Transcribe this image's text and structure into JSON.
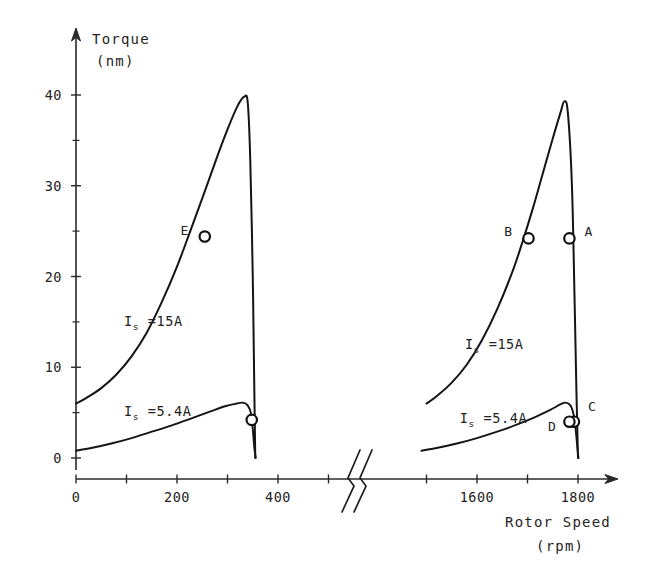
{
  "chart_data": {
    "type": "line",
    "title": "",
    "xlabel": "Rotor Speed",
    "xlabel_unit": "(rpm)",
    "ylabel": "Torque",
    "ylabel_unit": "(nm)",
    "grid": false,
    "legend_position": "inline-annotations",
    "axis_break": {
      "present": true,
      "between": [
        500,
        1450
      ],
      "symbol": "double-slash"
    },
    "ylim": [
      0,
      44
    ],
    "yticks": [
      0,
      10,
      20,
      30,
      40
    ],
    "ytick_labels": [
      "0",
      "10",
      "20",
      "30",
      "40"
    ],
    "yticks_minor": [
      5,
      15,
      25,
      35
    ],
    "xticks_left": [
      0,
      100,
      200,
      300,
      400,
      500
    ],
    "xtick_labels_left": [
      "0",
      "",
      "200",
      "",
      "400",
      ""
    ],
    "xticks_right": [
      1500,
      1600,
      1700,
      1800
    ],
    "xtick_labels_right": [
      "",
      "1600",
      "",
      "1800"
    ],
    "xlim_left": [
      0,
      560
    ],
    "xlim_right": [
      1440,
      1880
    ],
    "series": [
      {
        "name": "I_s =15A (low speed)",
        "current": "15A",
        "region": "left",
        "points": [
          [
            0,
            6.0
          ],
          [
            20,
            6.6
          ],
          [
            50,
            7.7
          ],
          [
            80,
            9.2
          ],
          [
            110,
            11.2
          ],
          [
            140,
            13.8
          ],
          [
            170,
            17.2
          ],
          [
            200,
            21.1
          ],
          [
            225,
            24.8
          ],
          [
            250,
            28.6
          ],
          [
            275,
            32.5
          ],
          [
            300,
            36.2
          ],
          [
            320,
            38.8
          ],
          [
            333,
            39.8
          ],
          [
            340,
            39.2
          ],
          [
            345,
            33.0
          ],
          [
            350,
            20.0
          ],
          [
            353,
            8.0
          ],
          [
            355,
            0.0
          ]
        ]
      },
      {
        "name": "I_s =5.4A (low speed)",
        "current": "5.4A",
        "region": "left",
        "points": [
          [
            0,
            0.8
          ],
          [
            30,
            1.1
          ],
          [
            70,
            1.6
          ],
          [
            110,
            2.2
          ],
          [
            150,
            2.9
          ],
          [
            190,
            3.6
          ],
          [
            230,
            4.4
          ],
          [
            265,
            5.1
          ],
          [
            295,
            5.7
          ],
          [
            318,
            6.0
          ],
          [
            330,
            6.1
          ],
          [
            340,
            5.8
          ],
          [
            347,
            4.8
          ],
          [
            350,
            3.2
          ],
          [
            353,
            1.2
          ],
          [
            356,
            0.0
          ]
        ]
      },
      {
        "name": "I_s =15A (high speed)",
        "current": "15A",
        "region": "right",
        "points": [
          [
            1500,
            6.0
          ],
          [
            1520,
            6.8
          ],
          [
            1550,
            8.3
          ],
          [
            1580,
            10.3
          ],
          [
            1610,
            13.0
          ],
          [
            1640,
            16.4
          ],
          [
            1670,
            20.5
          ],
          [
            1690,
            23.8
          ],
          [
            1710,
            27.4
          ],
          [
            1730,
            31.3
          ],
          [
            1750,
            35.2
          ],
          [
            1765,
            38.0
          ],
          [
            1773,
            39.3
          ],
          [
            1780,
            38.0
          ],
          [
            1788,
            30.0
          ],
          [
            1793,
            18.0
          ],
          [
            1797,
            7.0
          ],
          [
            1800,
            0.0
          ]
        ]
      },
      {
        "name": "I_s =5.4A (high speed)",
        "current": "5.4A",
        "region": "right",
        "points": [
          [
            1490,
            0.8
          ],
          [
            1520,
            1.1
          ],
          [
            1560,
            1.6
          ],
          [
            1600,
            2.2
          ],
          [
            1640,
            2.9
          ],
          [
            1680,
            3.7
          ],
          [
            1715,
            4.5
          ],
          [
            1745,
            5.3
          ],
          [
            1765,
            5.9
          ],
          [
            1775,
            6.1
          ],
          [
            1785,
            5.8
          ],
          [
            1792,
            4.6
          ],
          [
            1796,
            2.8
          ],
          [
            1799,
            1.0
          ],
          [
            1801,
            0.0
          ]
        ]
      }
    ],
    "annotations": [
      {
        "text": "I",
        "sub": "s",
        "rest": " =15A",
        "region": "left",
        "x": 95,
        "y": 14.6,
        "name": "label-left-15a"
      },
      {
        "text": "I",
        "sub": "s",
        "rest": " =5.4A",
        "region": "left",
        "x": 95,
        "y": 4.6,
        "name": "label-left-54a"
      },
      {
        "text": "I",
        "sub": "s",
        "rest": " =15A",
        "region": "right",
        "x": 1576,
        "y": 12.0,
        "name": "label-right-15a"
      },
      {
        "text": "I",
        "sub": "s",
        "rest": " =5.4A",
        "region": "right",
        "x": 1566,
        "y": 3.9,
        "name": "label-right-54a"
      }
    ],
    "points": [
      {
        "label": "A",
        "region": "right",
        "x": 1783,
        "y": 24.2,
        "label_side": "right",
        "name": "operating-point-a"
      },
      {
        "label": "B",
        "region": "right",
        "x": 1702,
        "y": 24.2,
        "label_side": "left",
        "name": "operating-point-b"
      },
      {
        "label": "C",
        "region": "right",
        "x": 1792,
        "y": 4.0,
        "label_side": "upper-right",
        "name": "operating-point-c"
      },
      {
        "label": "D",
        "region": "right",
        "x": 1783,
        "y": 4.0,
        "label_side": "lower-left",
        "name": "operating-point-d"
      },
      {
        "label": "E",
        "region": "left",
        "x": 255,
        "y": 24.4,
        "label_side": "left",
        "name": "operating-point-e"
      },
      {
        "label": "",
        "region": "left",
        "x": 348,
        "y": 4.2,
        "label_side": "none",
        "name": "operating-point-unlabeled"
      }
    ],
    "colors": {
      "curve": "#141414",
      "axis": "#2a2a2a",
      "text": "#232323",
      "background": "#ffffff",
      "marker_fill": "#ffffff"
    }
  }
}
